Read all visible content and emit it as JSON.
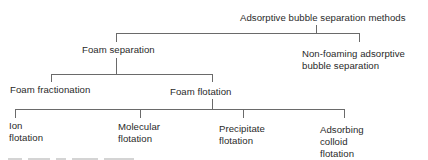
{
  "diagram": {
    "type": "tree",
    "root": {
      "label": "Adsorptive bubble separation methods"
    },
    "level1": [
      {
        "label": "Foam separation"
      },
      {
        "line1": "Non-foaming adsorptive",
        "line2": "bubble separation"
      }
    ],
    "level2": [
      {
        "label": "Foam fractionation"
      },
      {
        "label": "Foam flotation"
      }
    ],
    "level3": [
      {
        "line1": "Ion",
        "line2": "flotation"
      },
      {
        "line1": "Molecular",
        "line2": "flotation"
      },
      {
        "line1": "Precipitate",
        "line2": "flotation"
      },
      {
        "line1": "Adsorbing",
        "line2": "colloid",
        "line3": "flotation"
      }
    ],
    "edges": [
      [
        "Adsorptive bubble separation methods",
        "Foam separation"
      ],
      [
        "Adsorptive bubble separation methods",
        "Non-foaming adsorptive bubble separation"
      ],
      [
        "Foam separation",
        "Foam fractionation"
      ],
      [
        "Foam separation",
        "Foam flotation"
      ],
      [
        "Foam flotation",
        "Ion flotation"
      ],
      [
        "Foam flotation",
        "Molecular flotation"
      ],
      [
        "Foam flotation",
        "Precipitate flotation"
      ],
      [
        "Foam flotation",
        "Adsorbing colloid flotation"
      ]
    ],
    "line_color": "#6a6a6a",
    "text_color": "#2a2a2a"
  }
}
